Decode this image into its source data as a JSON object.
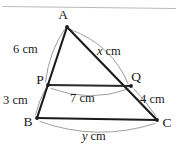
{
  "figure": {
    "background_color": "#ffffff",
    "line_color": "#1b1b1b",
    "arc_color": "#8d8d8d",
    "rule_color": "#b9b9b9",
    "vertices": [
      {
        "name": "A",
        "label": "A",
        "x": 67,
        "y": 27
      },
      {
        "name": "B",
        "label": "B",
        "x": 37,
        "y": 118
      },
      {
        "name": "C",
        "label": "C",
        "x": 157,
        "y": 120
      },
      {
        "name": "P",
        "label": "P",
        "x": 48,
        "y": 85
      },
      {
        "name": "Q",
        "label": "Q",
        "x": 131,
        "y": 86
      }
    ],
    "measurements": [
      {
        "name": "ap",
        "segment": "AP",
        "value": "6",
        "unit": "cm",
        "text": "6 cm",
        "variable": false
      },
      {
        "name": "aq",
        "segment": "AQ",
        "value": "x",
        "unit": "cm",
        "text": "x cm",
        "variable": true
      },
      {
        "name": "pb",
        "segment": "PB",
        "value": "3",
        "unit": "cm",
        "text": "3 cm",
        "variable": false
      },
      {
        "name": "qc",
        "segment": "QC",
        "value": "4",
        "unit": "cm",
        "text": "4 cm",
        "variable": false
      },
      {
        "name": "pq",
        "segment": "PQ",
        "value": "7",
        "unit": "cm",
        "text": "7 cm",
        "variable": false
      },
      {
        "name": "bc",
        "segment": "BC",
        "value": "y",
        "unit": "cm",
        "text": "y cm",
        "variable": true
      }
    ],
    "labels": {
      "vertex_a": "A",
      "vertex_b": "B",
      "vertex_c": "C",
      "vertex_p": "P",
      "vertex_q": "Q",
      "ap_value": "6 cm",
      "aq_var": "x",
      "aq_unit": "cm",
      "pb_value": "3 cm",
      "qc_value": "4 cm",
      "pq_value": "7 cm",
      "bc_var": "y",
      "bc_unit": "cm"
    }
  }
}
